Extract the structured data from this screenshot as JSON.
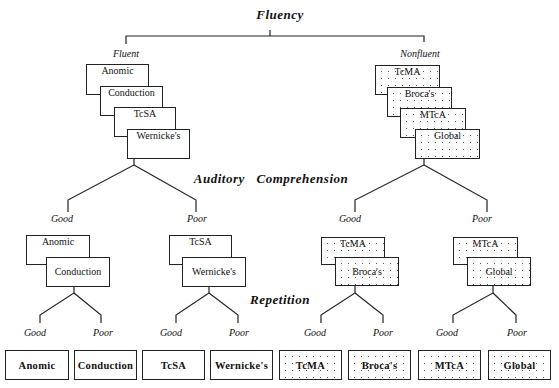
{
  "titles": {
    "fluency": "Fluency",
    "auditory_comprehension": "Auditory Comprehension",
    "repetition": "Repetition"
  },
  "level1": {
    "fluent": "Fluent",
    "nonfluent": "Nonfluent",
    "fluent_stack": [
      "Anomic",
      "Conduction",
      "TcSA",
      "Wernicke's"
    ],
    "nonfluent_stack": [
      "TcMA",
      "Broca's",
      "MTcA",
      "Global"
    ]
  },
  "level2": {
    "fluent_good": "Good",
    "fluent_poor": "Poor",
    "nonfluent_good": "Good",
    "nonfluent_poor": "Poor",
    "groups": [
      [
        "Anomic",
        "Conduction"
      ],
      [
        "TcSA",
        "Wernicke's"
      ],
      [
        "TcMA",
        "Broca's"
      ],
      [
        "MTcA",
        "Global"
      ]
    ]
  },
  "level3": {
    "labels": [
      "Good",
      "Poor",
      "Good",
      "Poor",
      "Good",
      "Poor",
      "Good",
      "Poor"
    ],
    "finals": [
      "Anomic",
      "Conduction",
      "TcSA",
      "Wernicke's",
      "TcMA",
      "Broca's",
      "MTcA",
      "Global"
    ]
  },
  "styles": {
    "fluent_fill": "plain white",
    "nonfluent_fill": "dotted pattern"
  }
}
